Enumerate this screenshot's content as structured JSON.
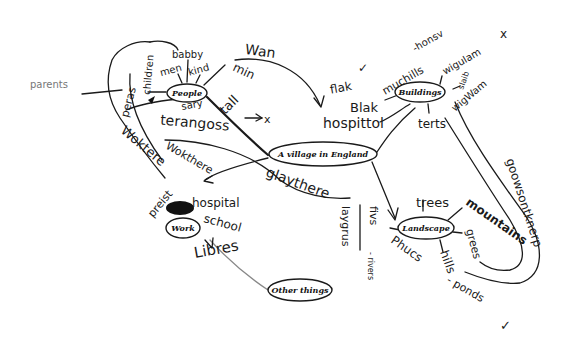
{
  "central": {
    "label": "A village in England"
  },
  "nodes": {
    "people": {
      "label": "People"
    },
    "buildings": {
      "label": "Buildings"
    },
    "landscape": {
      "label": "Landscape"
    },
    "work": {
      "label": "Work"
    },
    "other": {
      "label": "Other things"
    }
  },
  "words": {
    "parents": "parents",
    "peras": "peras",
    "children": "children",
    "babby": "babby",
    "men": "men",
    "kind": "kind",
    "min": "min",
    "tall": "tall",
    "sary": "sary",
    "terangoss": "terangoss",
    "x1": "x",
    "wan": "Wan",
    "woktere": "Woktere",
    "wokthere": "Wokthere",
    "flak": "flak",
    "tick1": "✓",
    "blak": "Blak",
    "hospittol": "hospittol",
    "muchills": "muchills",
    "honsv": "-honsv",
    "wigulam": "wigulam",
    "x2": "x",
    "slaib": "slaib",
    "wigwam": "wigWam",
    "terts": "terts",
    "preist": "preist",
    "hospital": "hospital",
    "school": "school",
    "libres": "Libres",
    "glaythere": "glaythere",
    "laygrus": "laygrus",
    "fivs": "fivs",
    "rivers": "- rivers",
    "trees": "trees",
    "mountains": "mountains",
    "grees": "grees",
    "hills": "hills",
    "phucs": "Phucs",
    "ponds": "- ponds",
    "tick2": "✓",
    "goowsontkner": "goowsontknerp"
  }
}
